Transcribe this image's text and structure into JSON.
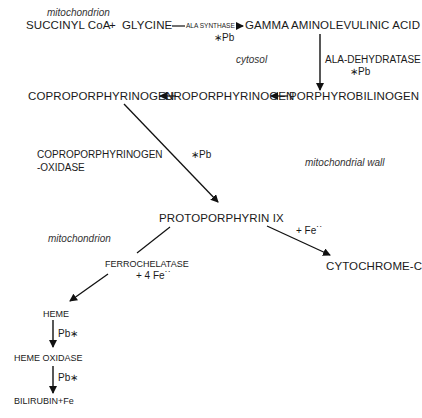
{
  "compartments": {
    "mitochondrion_top": "mitochondrion",
    "cytosol": "cytosol",
    "mitochondrial_wall": "mitochondrial wall",
    "mitochondrion_bottom": "mitochondrion"
  },
  "nodes": {
    "succinyl_coa": "SUCCINYL  CoA",
    "plus": "+",
    "glycine": "GLYCINE",
    "ala": "GAMMA AMINOLEVULINIC ACID",
    "porphobilinogen": "PORPHYROBILINOGEN",
    "uroporphyrinogen": "UROPORPHYRINOGEN",
    "coproporphyrinogen": "COPROPORPHYRINOGEN",
    "protoporphyrin": "PROTOPORPHYRIN   IX",
    "cytochrome_c": "CYTOCHROME-C",
    "heme": "HEME",
    "heme_oxidase": "HEME  OXIDASE",
    "bilirubin": "BILIRUBIN+Fe"
  },
  "enzymes": {
    "ala_synthase": "ALA SYNTHASE",
    "ala_synthase_inhibitor": "∗Pb",
    "ala_dehydratase": "ALA-DEHYDRATASE",
    "ala_dehydratase_inhibitor": "∗Pb",
    "copro_oxidase_line1": "COPROPORPHYRINOGEN",
    "copro_oxidase_line2": "-OXIDASE",
    "copro_oxidase_inhibitor": "∗Pb",
    "ferrochelatase": "FERROCHELATASE",
    "ferrochelatase_cofactor": "+  4 Fe˙˙",
    "cytochrome_cofactor": "+ Fe˙˙",
    "heme_step_inhibitor": "Pb∗",
    "oxidase_step_inhibitor": "Pb∗"
  }
}
